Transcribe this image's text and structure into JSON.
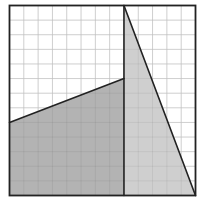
{
  "figure": {
    "type": "grid-area-diagram",
    "grid": {
      "cols": 13,
      "rows": 13
    },
    "colors": {
      "background": "#ffffff",
      "grid_line": "#dcdcdc",
      "outline": "#222222",
      "dark_fill": "#b3b3b3",
      "light_fill": "#cfcfcf"
    },
    "shapes": [
      {
        "name": "left-quadrilateral",
        "fill": "dark",
        "points_grid": [
          [
            0,
            0
          ],
          [
            8,
            0
          ],
          [
            8,
            8
          ],
          [
            0,
            5
          ]
        ]
      },
      {
        "name": "right-triangle",
        "fill": "light",
        "points_grid": [
          [
            8,
            0
          ],
          [
            13,
            0
          ],
          [
            8,
            13
          ]
        ]
      }
    ],
    "lines": [
      {
        "name": "vertical-divider",
        "from": [
          8,
          0
        ],
        "to": [
          8,
          13
        ]
      },
      {
        "name": "sloped-line",
        "from": [
          0,
          5
        ],
        "to": [
          8,
          8
        ]
      },
      {
        "name": "diagonal-line",
        "from": [
          8,
          13
        ],
        "to": [
          13,
          0
        ]
      }
    ]
  }
}
